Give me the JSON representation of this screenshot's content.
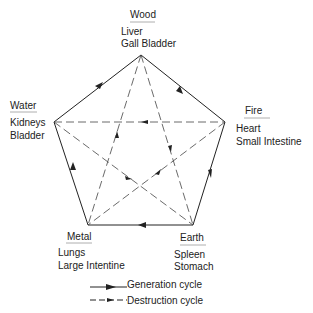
{
  "elements": [
    {
      "name": "Wood",
      "organs": [
        "Liver",
        "Gall Bladder"
      ]
    },
    {
      "name": "Fire",
      "organs": [
        "Heart",
        "Small Intestine"
      ]
    },
    {
      "name": "Earth",
      "organs": [
        "Spleen",
        "Stomach"
      ]
    },
    {
      "name": "Metal",
      "organs": [
        "Lungs",
        "Large Intentine"
      ]
    },
    {
      "name": "Water",
      "organs": [
        "Kidneys",
        "Bladder"
      ]
    }
  ],
  "legend": {
    "generation": "Generation cycle",
    "destruction": "Destruction cycle"
  },
  "colors": {
    "line": "#222222"
  }
}
